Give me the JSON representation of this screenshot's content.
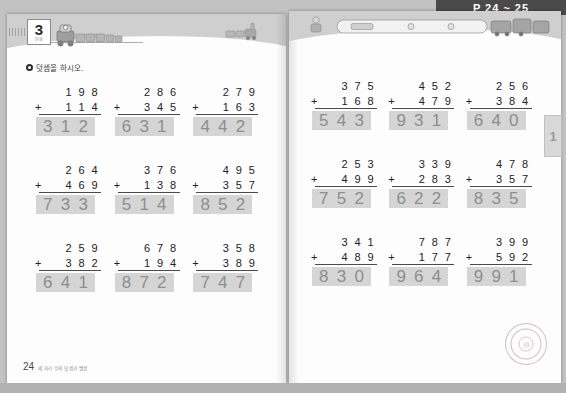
{
  "scan": {
    "top_band_label": "P 24 ~ 25"
  },
  "left_page": {
    "unit_number": "3",
    "unit_sub": "단원",
    "instruction": "덧셈을 하시오.",
    "footer_page": "24",
    "footer_note": "세 자리 수의 덧셈과 뺄셈",
    "problems": [
      {
        "top": "198",
        "bottom": "114",
        "operator": "+",
        "answer": "312"
      },
      {
        "top": "286",
        "bottom": "345",
        "operator": "+",
        "answer": "631"
      },
      {
        "top": "279",
        "bottom": "163",
        "operator": "+",
        "answer": "442"
      },
      {
        "top": "264",
        "bottom": "469",
        "operator": "+",
        "answer": "733"
      },
      {
        "top": "376",
        "bottom": "138",
        "operator": "+",
        "answer": "514"
      },
      {
        "top": "495",
        "bottom": "357",
        "operator": "+",
        "answer": "852"
      },
      {
        "top": "259",
        "bottom": "382",
        "operator": "+",
        "answer": "641"
      },
      {
        "top": "678",
        "bottom": "194",
        "operator": "+",
        "answer": "872"
      },
      {
        "top": "358",
        "bottom": "389",
        "operator": "+",
        "answer": "747"
      }
    ]
  },
  "right_page": {
    "side_tab_label": "1",
    "problems": [
      {
        "top": "375",
        "bottom": "168",
        "operator": "+",
        "answer": "543"
      },
      {
        "top": "452",
        "bottom": "479",
        "operator": "+",
        "answer": "931"
      },
      {
        "top": "256",
        "bottom": "384",
        "operator": "+",
        "answer": "640"
      },
      {
        "top": "253",
        "bottom": "499",
        "operator": "+",
        "answer": "752"
      },
      {
        "top": "339",
        "bottom": "283",
        "operator": "+",
        "answer": "622"
      },
      {
        "top": "478",
        "bottom": "357",
        "operator": "+",
        "answer": "835"
      },
      {
        "top": "341",
        "bottom": "489",
        "operator": "+",
        "answer": "830"
      },
      {
        "top": "787",
        "bottom": "177",
        "operator": "+",
        "answer": "964"
      },
      {
        "top": "399",
        "bottom": "592",
        "operator": "+",
        "answer": "991"
      }
    ],
    "seal_text": "검인"
  },
  "colors": {
    "scan_background": "#c2c2c2",
    "page_background": "#fdfdfd",
    "header_band": "#cfcfcf",
    "answer_highlight": "#d5d5d5",
    "answer_text": "#8e8e8e",
    "problem_text": "#222222",
    "top_band": "#4a4a4a"
  }
}
